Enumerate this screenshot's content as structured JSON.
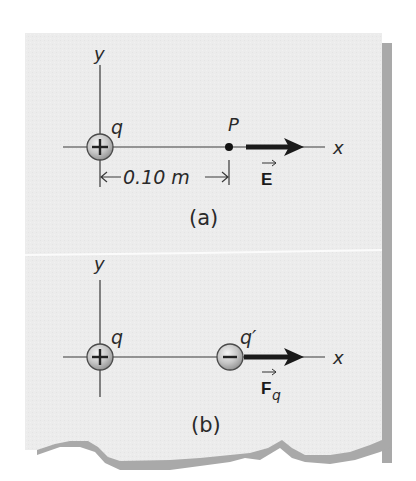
{
  "figure": {
    "colors": {
      "page": "#ffffff",
      "paper": "#ececec",
      "paper_shadow": "#a8a8a8",
      "ink": "#2a2a2a",
      "arrow": "#1a1a1a",
      "charge_fill": "#b8b8b8",
      "divider": "#fafafa"
    },
    "panel_a": {
      "y_axis_label": "y",
      "x_axis_label": "x",
      "source_charge": {
        "label": "q",
        "sign": "+"
      },
      "point_label": "P",
      "distance_label": "0.10 m",
      "vector_label": "E",
      "caption": "(a)"
    },
    "panel_b": {
      "y_axis_label": "y",
      "x_axis_label": "x",
      "source_charge": {
        "label": "q",
        "sign": "+"
      },
      "test_charge": {
        "label": "q′",
        "sign": "−"
      },
      "vector_label": "F",
      "vector_subscript": "q",
      "caption": "(b)"
    }
  }
}
